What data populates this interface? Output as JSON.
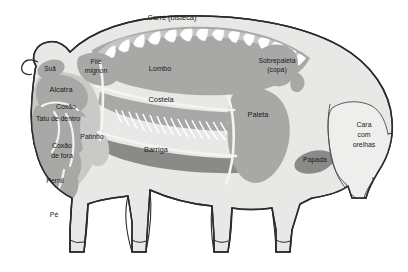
{
  "diagram": {
    "language": "pt-BR",
    "background_color": "#ffffff",
    "outline_color": "#2b2b2b",
    "body_fill": "#e8e8e6",
    "cut_fill_light": "#c9c9c7",
    "cut_fill_mid": "#a8a8a6",
    "cut_fill_dark": "#8a8a88",
    "bone_color": "#ffffff"
  },
  "cuts": [
    {
      "id": "carre",
      "label": "Carré (bisteca)",
      "x": 172,
      "y": 18,
      "lines": [
        "Carré (bisteca)"
      ]
    },
    {
      "id": "sua",
      "label": "Suã",
      "x": 50,
      "y": 69,
      "lines": [
        "Suã"
      ]
    },
    {
      "id": "file-mignon",
      "label": "Filé mignon",
      "x": 96,
      "y": 65,
      "lines": [
        "Filé",
        "mignon"
      ]
    },
    {
      "id": "lombo",
      "label": "Lombo",
      "x": 160,
      "y": 69,
      "lines": [
        "Lombo"
      ]
    },
    {
      "id": "sobrepaleta",
      "label": "Sobrepaleta (copa)",
      "x": 277,
      "y": 64,
      "lines": [
        "Sobrepaleta",
        "(copa)"
      ]
    },
    {
      "id": "alcatra",
      "label": "Alcatra",
      "x": 61,
      "y": 90,
      "lines": [
        "Alcatra"
      ]
    },
    {
      "id": "costela",
      "label": "Costela",
      "x": 161,
      "y": 100,
      "lines": [
        "Costela"
      ]
    },
    {
      "id": "paleta",
      "label": "Paleta",
      "x": 258,
      "y": 115,
      "lines": [
        "Paleta"
      ]
    },
    {
      "id": "coxao",
      "label": "Coxão",
      "x": 66,
      "y": 107,
      "lines": [
        "Coxão"
      ]
    },
    {
      "id": "tatu-dentro",
      "label": "Tatu de dentro",
      "x": 58,
      "y": 119,
      "lines": [
        "Tatu de dentro"
      ]
    },
    {
      "id": "cara-orelhas",
      "label": "Cara com orelhas",
      "x": 364,
      "y": 134,
      "lines": [
        "Cara",
        "com",
        "orelhas"
      ]
    },
    {
      "id": "patinho",
      "label": "Patinho",
      "x": 92,
      "y": 137,
      "lines": [
        "Patinho"
      ]
    },
    {
      "id": "coxao-fora",
      "label": "Coxão de fora",
      "x": 62,
      "y": 150,
      "lines": [
        "Coxão",
        "de fora"
      ]
    },
    {
      "id": "barriga",
      "label": "Barriga",
      "x": 156,
      "y": 150,
      "lines": [
        "Barriga"
      ]
    },
    {
      "id": "papada",
      "label": "Papada",
      "x": 315,
      "y": 160,
      "lines": [
        "Papada"
      ]
    },
    {
      "id": "pernil",
      "label": "Pernil",
      "x": 55,
      "y": 181,
      "lines": [
        "Pernil"
      ]
    },
    {
      "id": "pe",
      "label": "Pé",
      "x": 54,
      "y": 215,
      "lines": [
        "Pé"
      ]
    }
  ]
}
